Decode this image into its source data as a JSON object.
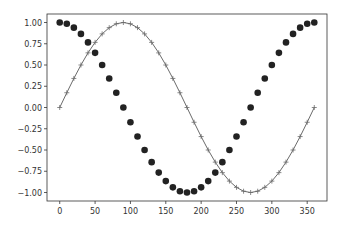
{
  "chart_data": {
    "type": "line",
    "title": "",
    "xlabel": "",
    "ylabel": "",
    "xlim": [
      -18,
      378
    ],
    "ylim": [
      -1.1,
      1.1
    ],
    "grid": false,
    "legend": null,
    "x_ticks": [
      0,
      50,
      100,
      150,
      200,
      250,
      300,
      350
    ],
    "y_ticks": [
      1.0,
      0.75,
      0.5,
      0.25,
      0.0,
      -0.25,
      -0.5,
      -0.75,
      -1.0
    ],
    "x_tick_labels": [
      "0",
      "50",
      "100",
      "150",
      "200",
      "250",
      "300",
      "350"
    ],
    "y_tick_labels": [
      "1.00",
      "0.75",
      "0.50",
      "0.25",
      "0.00",
      "−0.25",
      "−0.50",
      "−0.75",
      "−1.00"
    ],
    "series": [
      {
        "name": "sin",
        "function": "sin(x degrees)",
        "x_start": 0,
        "x_end": 360,
        "step": 10,
        "style": "line with + markers",
        "color": "#6b6b6b"
      },
      {
        "name": "cos",
        "function": "cos(x degrees)",
        "x_start": 0,
        "x_end": 360,
        "step": 10,
        "style": "circle markers",
        "color": "#222222"
      }
    ]
  }
}
